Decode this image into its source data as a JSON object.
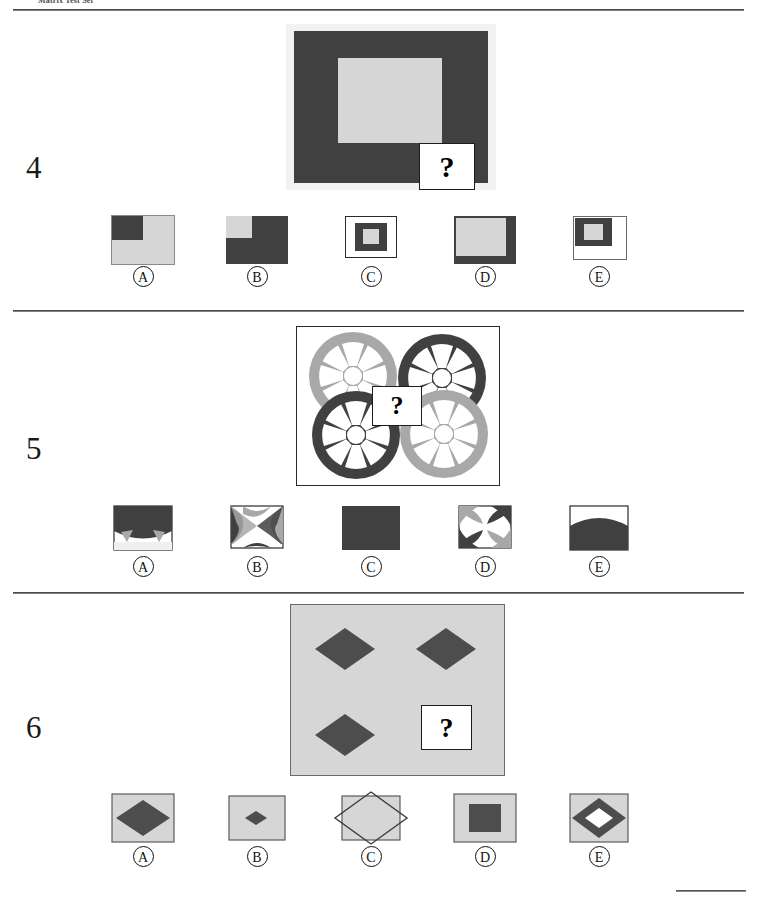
{
  "header": {
    "title": "Matrix Test Set"
  },
  "palette": {
    "dark_gray": "#404040",
    "mid_gray": "#a8a8a8",
    "light_gray": "#d4d4d4",
    "white": "#ffffff",
    "outline": "#1c1c1c",
    "text": "#111111"
  },
  "question_mark": "?",
  "items": [
    {
      "number": "4",
      "stimulus": {
        "description": "dark-gray-square-with-light-gray-inner-square",
        "frame_color": "#f0f0f0",
        "outer_color": "#404040",
        "inner_color": "#d4d4d4"
      },
      "options": [
        {
          "letter": "A",
          "description": "light-gray-square-with-dark-gray-top-left-quadrant"
        },
        {
          "letter": "B",
          "description": "dark-gray-square-with-light-gray-top-left-quadrant"
        },
        {
          "letter": "C",
          "description": "white-box-dark-gray-square-with-small-light-gray-center"
        },
        {
          "letter": "D",
          "description": "dark-gray-square-with-light-gray-offset-to-top-left"
        },
        {
          "letter": "E",
          "description": "white-box-with-small-dark-gray-square-top-left-and-light-gray-center"
        }
      ]
    },
    {
      "number": "5",
      "stimulus": {
        "description": "four-spoked-wheels-two-light-two-dark",
        "wheels": [
          {
            "position": "top-left",
            "color": "#a8a8a8"
          },
          {
            "position": "top-right",
            "color": "#404040"
          },
          {
            "position": "bottom-left",
            "color": "#404040"
          },
          {
            "position": "bottom-right",
            "color": "#a8a8a8"
          }
        ]
      },
      "options": [
        {
          "letter": "A",
          "description": "dark-fill-upper-with-light-wedges-lower"
        },
        {
          "letter": "B",
          "description": "interlocking-dark-and-light-curved-bands-on-white"
        },
        {
          "letter": "C",
          "description": "solid-dark-gray-rectangle"
        },
        {
          "letter": "D",
          "description": "four-corner-curved-arcs-dark-and-light-on-white"
        },
        {
          "letter": "E",
          "description": "dark-dome-filling-lower-portion"
        }
      ]
    },
    {
      "number": "6",
      "stimulus": {
        "description": "light-gray-field-with-three-dark-diamonds",
        "background_color": "#d4d4d4",
        "diamond_color": "#4a4a4a",
        "diamond_count": 3
      },
      "options": [
        {
          "letter": "A",
          "description": "large-dark-diamond-on-light-gray"
        },
        {
          "letter": "B",
          "description": "small-dark-diamond-on-light-gray"
        },
        {
          "letter": "C",
          "description": "large-outlined-diamond-overflowing-light-gray-box"
        },
        {
          "letter": "D",
          "description": "dark-square-on-light-gray"
        },
        {
          "letter": "E",
          "description": "dark-diamond-with-white-diamond-inside-on-light-gray"
        }
      ]
    }
  ]
}
